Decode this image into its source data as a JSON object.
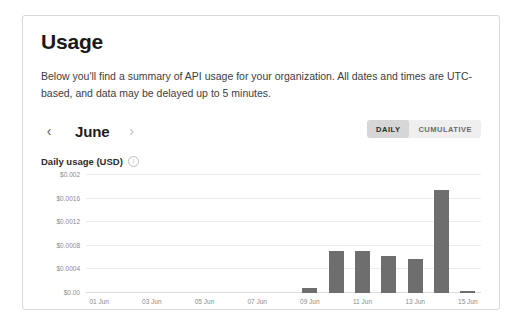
{
  "page": {
    "title": "Usage",
    "description": "Below you'll find a summary of API usage for your organization. All dates and times are UTC-based, and data may be delayed up to 5 minutes."
  },
  "controls": {
    "prev_icon": "‹",
    "next_icon": "›",
    "month": "June",
    "toggle": {
      "options": [
        "DAILY",
        "CUMULATIVE"
      ],
      "selected": "DAILY"
    }
  },
  "chart_section": {
    "label": "Daily usage (USD)",
    "info_icon": "i"
  },
  "colors": {
    "bar": "#6e6e6e",
    "grid": "#ececec",
    "axis": "#dcdcdc",
    "toggle_track": "#efefef",
    "toggle_active": "#d6d6d6",
    "card_border": "#d8d8d8",
    "text": "#1a1a1a",
    "muted": "#8a8a8a"
  },
  "chart_data": {
    "type": "bar",
    "title": "Daily usage (USD)",
    "xlabel": "",
    "ylabel": "",
    "ylim": [
      0,
      0.002
    ],
    "grid": true,
    "legend": false,
    "ytick_labels": [
      "$0.002",
      "$0.0016",
      "$0.0012",
      "$0.0008",
      "$0.0004",
      "$0.00"
    ],
    "ytick_values": [
      0.002,
      0.0016,
      0.0012,
      0.0008,
      0.0004,
      0
    ],
    "categories": [
      "01 Jun",
      "02 Jun",
      "03 Jun",
      "04 Jun",
      "05 Jun",
      "06 Jun",
      "07 Jun",
      "08 Jun",
      "09 Jun",
      "10 Jun",
      "11 Jun",
      "12 Jun",
      "13 Jun",
      "14 Jun",
      "15 Jun"
    ],
    "xtick_labels": [
      "01 Jun",
      "03 Jun",
      "05 Jun",
      "07 Jun",
      "09 Jun",
      "11 Jun",
      "13 Jun",
      "15 Jun"
    ],
    "xtick_indices": [
      0,
      2,
      4,
      6,
      8,
      10,
      12,
      14
    ],
    "values": [
      0,
      0,
      0,
      0,
      0,
      0,
      0,
      0,
      9e-05,
      0.00072,
      0.00072,
      0.00062,
      0.00057,
      0.00175,
      4e-05
    ]
  }
}
